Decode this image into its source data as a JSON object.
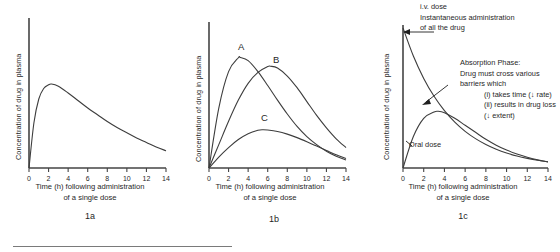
{
  "figure": {
    "panels": [
      {
        "id": "1a",
        "caption": "1a",
        "ylabel": "Concentration of drug in plasma",
        "xlabel_line1": "Time (h) following administration",
        "xlabel_line2": "of a single dose",
        "ticks": [
          "0",
          "2",
          "4",
          "6",
          "8",
          "10",
          "12",
          "14"
        ]
      },
      {
        "id": "1b",
        "caption": "1b",
        "ylabel": "Concentration of drug in plasma",
        "xlabel_line1": "Time (h) following administration",
        "xlabel_line2": "of a single dose",
        "ticks": [
          "0",
          "2",
          "4",
          "6",
          "8",
          "10",
          "12",
          "14"
        ],
        "curve_labels": [
          "A",
          "B",
          "C"
        ]
      },
      {
        "id": "1c",
        "caption": "1c",
        "ylabel": "Concentration of drug in plasma",
        "xlabel_line1": "Time (h) following administration",
        "xlabel_line2": "of a single dose",
        "ticks": [
          "0",
          "2",
          "4",
          "6",
          "8",
          "10",
          "12",
          "14"
        ],
        "annotations": {
          "iv": [
            "i.v. dose",
            "Instantaneous administration",
            "of all the drug"
          ],
          "absorption": [
            "Absorption Phase:",
            "Drug must cross various",
            "barriers which",
            "(i) takes time (↓ rate)",
            "(ii) results in drug loss",
            "(↓ extent)"
          ],
          "oral": "Oral dose"
        }
      }
    ]
  },
  "chart_data": [
    {
      "type": "line",
      "title": "1a",
      "xlabel": "Time (h) following administration of a single dose",
      "ylabel": "Concentration of drug in plasma",
      "xlim": [
        0,
        14
      ],
      "ylim": [
        0,
        1.0
      ],
      "xticks": [
        0,
        2,
        4,
        6,
        8,
        10,
        12,
        14
      ],
      "grid": false,
      "legend": "none",
      "series": [
        {
          "name": "single oral dose",
          "x": [
            0,
            0.5,
            1,
            1.5,
            2,
            2.3,
            3,
            4,
            5,
            6,
            7,
            8,
            9,
            10,
            11,
            12,
            13,
            14
          ],
          "y": [
            0.0,
            0.3,
            0.46,
            0.53,
            0.555,
            0.56,
            0.545,
            0.5,
            0.45,
            0.4,
            0.355,
            0.31,
            0.27,
            0.235,
            0.2,
            0.17,
            0.14,
            0.115
          ]
        }
      ]
    },
    {
      "type": "line",
      "title": "1b",
      "xlabel": "Time (h) following administration of a single dose",
      "ylabel": "Concentration of drug in plasma",
      "xlim": [
        0,
        14
      ],
      "ylim": [
        0,
        1.0
      ],
      "xticks": [
        0,
        2,
        4,
        6,
        8,
        10,
        12,
        14
      ],
      "grid": false,
      "legend": "inline-labels",
      "series": [
        {
          "name": "A",
          "x": [
            0,
            1,
            2,
            3,
            3.2,
            4,
            5,
            6,
            7,
            8,
            9,
            10,
            11,
            12,
            13,
            14
          ],
          "y": [
            0.0,
            0.41,
            0.66,
            0.755,
            0.757,
            0.735,
            0.66,
            0.565,
            0.465,
            0.37,
            0.285,
            0.215,
            0.16,
            0.115,
            0.08,
            0.055
          ]
        },
        {
          "name": "B",
          "x": [
            0,
            1,
            2,
            3,
            4,
            5,
            6,
            6.3,
            7,
            8,
            9,
            10,
            11,
            12,
            13,
            14
          ],
          "y": [
            0.0,
            0.16,
            0.32,
            0.465,
            0.58,
            0.655,
            0.695,
            0.697,
            0.685,
            0.63,
            0.55,
            0.455,
            0.36,
            0.275,
            0.2,
            0.14
          ]
        },
        {
          "name": "C",
          "x": [
            0,
            1,
            2,
            3,
            4,
            5,
            5.5,
            6,
            7,
            8,
            9,
            10,
            11,
            12,
            13,
            14
          ],
          "y": [
            0.0,
            0.075,
            0.14,
            0.195,
            0.235,
            0.258,
            0.262,
            0.26,
            0.25,
            0.232,
            0.208,
            0.18,
            0.15,
            0.12,
            0.09,
            0.065
          ]
        }
      ]
    },
    {
      "type": "line",
      "title": "1c",
      "xlabel": "Time (h) following administration of a single dose",
      "ylabel": "Concentration of drug in plasma",
      "xlim": [
        0,
        14
      ],
      "ylim": [
        0,
        1.0
      ],
      "xticks": [
        0,
        2,
        4,
        6,
        8,
        10,
        12,
        14
      ],
      "grid": false,
      "legend": "annotations",
      "series": [
        {
          "name": "i.v. dose",
          "x": [
            0,
            1,
            2,
            3,
            4,
            5,
            6,
            7,
            8,
            9,
            10,
            11,
            12,
            13,
            14
          ],
          "y": [
            1.0,
            0.8,
            0.64,
            0.512,
            0.41,
            0.328,
            0.262,
            0.21,
            0.168,
            0.134,
            0.107,
            0.086,
            0.069,
            0.055,
            0.044
          ]
        },
        {
          "name": "Oral dose",
          "x": [
            0,
            1,
            2,
            3,
            3.4,
            4,
            5,
            6,
            7,
            8,
            9,
            10,
            11,
            12,
            13,
            14
          ],
          "y": [
            0.0,
            0.225,
            0.355,
            0.4,
            0.405,
            0.395,
            0.355,
            0.305,
            0.255,
            0.205,
            0.163,
            0.128,
            0.1,
            0.077,
            0.058,
            0.044
          ]
        }
      ]
    }
  ]
}
